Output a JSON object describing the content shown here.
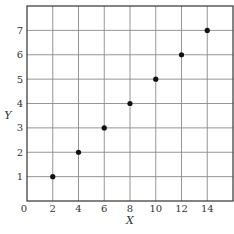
{
  "chart_data": {
    "type": "scatter",
    "title": "",
    "xlabel": "X",
    "ylabel": "Y",
    "xlim": [
      0,
      16
    ],
    "ylim": [
      0,
      8
    ],
    "grid": true,
    "legend": null,
    "x_ticks": [
      "0",
      "2",
      "4",
      "6",
      "8",
      "10",
      "12",
      "14"
    ],
    "y_ticks": [
      "1",
      "2",
      "3",
      "4",
      "5",
      "6",
      "7"
    ],
    "x": [
      2,
      4,
      6,
      8,
      10,
      12,
      14
    ],
    "y": [
      1,
      2,
      3,
      4,
      5,
      6,
      7
    ],
    "point_color": "#111111",
    "grid_color": "#8a8a8a",
    "frame_color": "#333333"
  }
}
